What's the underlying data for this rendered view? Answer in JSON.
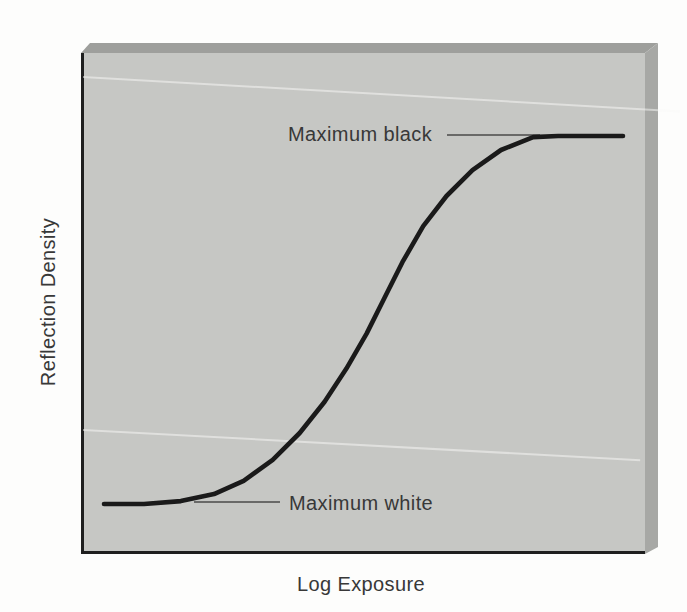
{
  "figure": {
    "labels": {
      "y_axis": "Reflection Density",
      "x_axis": "Log Exposure",
      "upper_annotation": "Maximum black",
      "lower_annotation": "Maximum white"
    },
    "colors": {
      "page_background": "#fdfdfc",
      "panel_face": "#c6c7c4",
      "panel_top_bevel": "#9e9f9c",
      "panel_right_bevel": "#a7a8a5",
      "axis": "#1f1f1f",
      "curve": "#1a1a1a",
      "pointer_line": "#4a4a4a",
      "text": "#383838"
    }
  },
  "chart_data": {
    "type": "line",
    "title": "",
    "xlabel": "Log Exposure",
    "ylabel": "Reflection Density",
    "x_range": [
      0,
      1
    ],
    "y_range": [
      0,
      1
    ],
    "axis_ticks": false,
    "grid": false,
    "legend": false,
    "x": [
      0,
      0.038,
      0.077,
      0.148,
      0.212,
      0.269,
      0.325,
      0.377,
      0.425,
      0.467,
      0.506,
      0.54,
      0.575,
      0.615,
      0.66,
      0.71,
      0.765,
      0.827,
      0.875,
      0.937,
      1.0
    ],
    "y": [
      0,
      0,
      0,
      0.008,
      0.027,
      0.063,
      0.12,
      0.193,
      0.278,
      0.368,
      0.463,
      0.559,
      0.657,
      0.755,
      0.837,
      0.907,
      0.962,
      0.997,
      1.0,
      1.0,
      1.0
    ],
    "annotations": [
      {
        "text": "Maximum black",
        "points_to": "upper asymptote (y = 1.0)"
      },
      {
        "text": "Maximum white",
        "points_to": "lower asymptote (y = 0.0)"
      }
    ]
  }
}
